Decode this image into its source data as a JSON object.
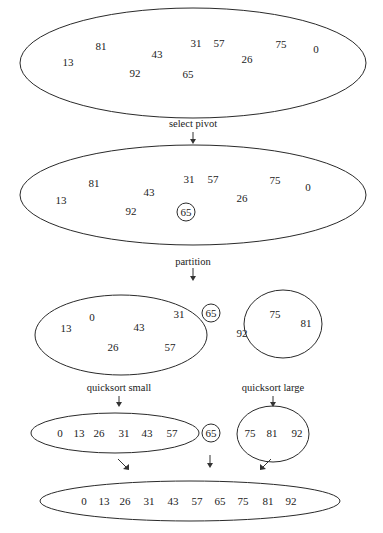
{
  "diagram": {
    "stages": {
      "input": {
        "values": [
          "81",
          "31",
          "57",
          "75",
          "0",
          "43",
          "13",
          "26",
          "92",
          "65"
        ]
      },
      "select_pivot": {
        "label": "select pivot",
        "values": [
          "81",
          "31",
          "57",
          "75",
          "0",
          "43",
          "13",
          "26",
          "92"
        ],
        "pivot": "65"
      },
      "partition": {
        "label": "partition",
        "small": [
          "0",
          "31",
          "13",
          "43",
          "26",
          "57"
        ],
        "pivot": "65",
        "large": [
          "75",
          "81",
          "92"
        ]
      },
      "recurse": {
        "small_label": "quicksort small",
        "large_label": "quicksort large",
        "small_sorted": [
          "0",
          "13",
          "26",
          "31",
          "43",
          "57"
        ],
        "pivot": "65",
        "large_sorted": [
          "75",
          "81",
          "92"
        ]
      },
      "result": {
        "values": [
          "0",
          "13",
          "26",
          "31",
          "43",
          "57",
          "65",
          "75",
          "81",
          "92"
        ]
      }
    }
  }
}
